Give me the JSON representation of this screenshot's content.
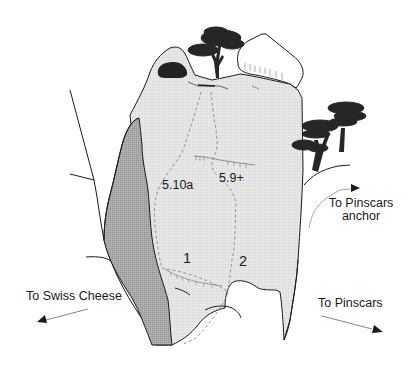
{
  "diagram": {
    "type": "climbing-topo",
    "colors": {
      "rock_face": "#e4e4e4",
      "shadow_face": "#a9a9a9",
      "outline": "#1a1a1a",
      "route_line": "#8a8a8a",
      "tree": "#262626",
      "background": "#ffffff"
    },
    "routes": [
      {
        "number": "1",
        "grade": "5.10a"
      },
      {
        "number": "2",
        "grade": "5.9+"
      }
    ],
    "directions": [
      {
        "text": "To Swiss Cheese",
        "direction": "down-left"
      },
      {
        "text_line1": "To Pinscars",
        "text_line2": "anchor",
        "direction": "up-right"
      },
      {
        "text": "To Pinscars",
        "direction": "down-right"
      }
    ]
  }
}
